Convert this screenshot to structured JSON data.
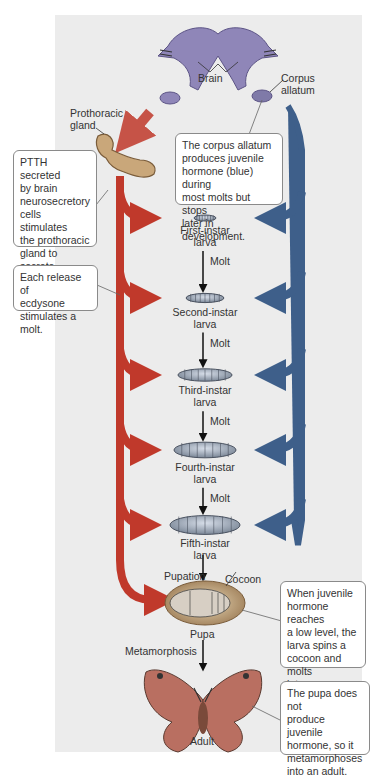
{
  "colors": {
    "ecdysone": "#c0392b",
    "juvenile_hormone": "#3e5f8a",
    "brain": "#8f86b8",
    "gland": "#c9a77a",
    "panel": "#ececec",
    "callout_border": "#8a8a8a"
  },
  "labels": {
    "brain": "Brain",
    "corpus_allatum": [
      "Corpus",
      "allatum"
    ],
    "prothoracic_gland": [
      "Prothoracic",
      "gland"
    ],
    "cocoon": "Cocoon",
    "pupa": "Pupa",
    "adult": "Adult",
    "pupation": "Pupation",
    "metamorphosis": "Metamorphosis"
  },
  "stages": [
    {
      "name": "First-instar",
      "sub": "larva"
    },
    {
      "name": "Second-instar",
      "sub": "larva"
    },
    {
      "name": "Third-instar",
      "sub": "larva"
    },
    {
      "name": "Fourth-instar",
      "sub": "larva"
    },
    {
      "name": "Fifth-instar",
      "sub": "larva"
    }
  ],
  "molt_label": "Molt",
  "callouts": {
    "ptth": [
      "PTTH secreted",
      "by brain",
      "neurosecretory",
      "cells stimulates",
      "the prothoracic",
      "gland to secrete",
      "ecdysone (red)."
    ],
    "release": [
      "Each release of",
      "ecdysone",
      "stimulates a molt."
    ],
    "corpus": [
      "The corpus allatum",
      "produces juvenile",
      "hormone (blue) during",
      "most molts but stops",
      "later in development."
    ],
    "low_level": [
      "When juvenile",
      "hormone reaches",
      "a low level, the",
      "larva spins a",
      "cocoon and molts",
      "into a pupa."
    ],
    "no_jh": [
      "The pupa does not",
      "produce juvenile",
      "hormone, so it",
      "metamorphoses",
      "into an adult."
    ]
  }
}
